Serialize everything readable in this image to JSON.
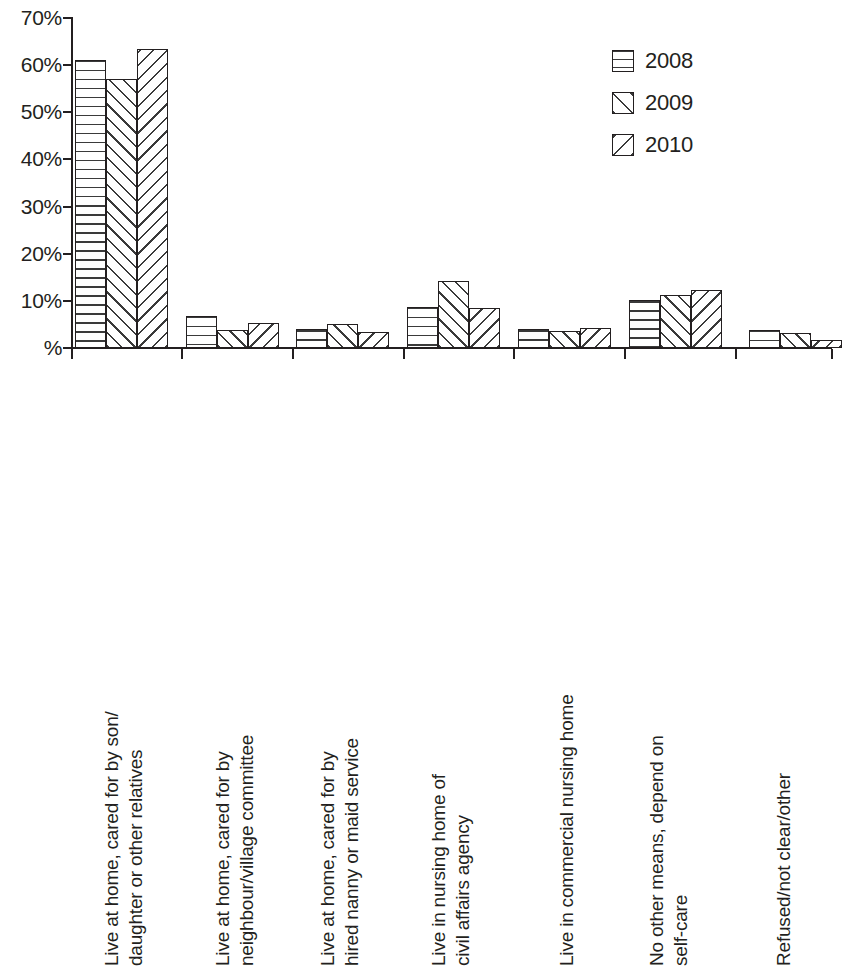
{
  "chart_data": {
    "type": "bar",
    "title": "",
    "subtitle": "",
    "xlabel": "",
    "ylabel": "",
    "ylim": [
      0,
      70
    ],
    "ytick_values": [
      0,
      10,
      20,
      30,
      40,
      50,
      60,
      70
    ],
    "ytick_labels": [
      "%",
      "10%",
      "20%",
      "30%",
      "40%",
      "50%",
      "60%",
      "70%"
    ],
    "grid": false,
    "legend_position": "top-right",
    "categories": [
      "Live at home, cared for by son/daughter or other relatives",
      "Live at home, cared for by neighbour/village committee",
      "Live at home, cared for by hired nanny or maid service",
      "Live in nursing home of civil affairs agency",
      "Live in commercial nursing home",
      "No other means, depend on self-care",
      "Refused/not clear/other"
    ],
    "category_lines": [
      [
        "Live at home, cared for by son/",
        "daughter or other relatives"
      ],
      [
        "Live at home, cared for by",
        "neighbour/village committee"
      ],
      [
        "Live at home, cared for by",
        "hired nanny or maid service"
      ],
      [
        "Live in nursing home of",
        "civil affairs agency"
      ],
      [
        "Live in commercial nursing home",
        ""
      ],
      [
        "No other means, depend on",
        "self-care"
      ],
      [
        "Refused/not clear/other",
        ""
      ]
    ],
    "series": [
      {
        "name": "2008",
        "pattern": "horizontal-lines",
        "values": [
          61.2,
          6.8,
          4.0,
          8.7,
          4.1,
          10.2,
          3.9
        ]
      },
      {
        "name": "2009",
        "pattern": "backward-diagonal-lines",
        "values": [
          57.0,
          3.8,
          5.2,
          14.2,
          3.6,
          11.3,
          3.2
        ]
      },
      {
        "name": "2010",
        "pattern": "forward-diagonal-lines",
        "values": [
          63.5,
          5.3,
          3.5,
          8.5,
          4.3,
          12.4,
          1.6
        ]
      }
    ],
    "colors": {
      "axis": "#231f20",
      "bar_outline": "#231f20",
      "hatch": "#3a3a3a",
      "background": "#ffffff"
    }
  },
  "legend": {
    "items": [
      {
        "label": "2008",
        "pattern": "horizontal-lines"
      },
      {
        "label": "2009",
        "pattern": "backward-diagonal-lines"
      },
      {
        "label": "2010",
        "pattern": "forward-diagonal-lines"
      }
    ]
  },
  "axis": {
    "y_labels": [
      "70%",
      "60%",
      "50%",
      "40%",
      "30%",
      "20%",
      "10%",
      "%"
    ]
  }
}
